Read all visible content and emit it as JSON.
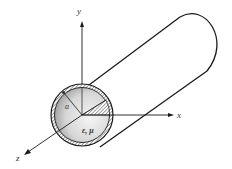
{
  "diagram": {
    "axes": {
      "x_label": "x",
      "y_label": "y",
      "z_label": "z"
    },
    "labels": {
      "radius": "a",
      "material": "ε, μ"
    },
    "colors": {
      "stroke": "#1a1a1a",
      "fill_light": "#f2f2f2",
      "fill_dark": "#9a9a9a",
      "background": "#ffffff"
    }
  }
}
